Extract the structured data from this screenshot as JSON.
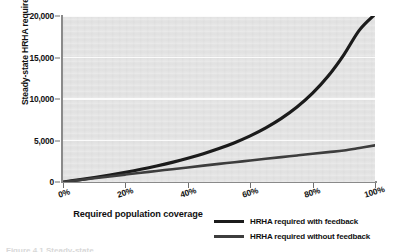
{
  "chart_data": {
    "type": "line",
    "title": "",
    "xlabel": "Required population coverage",
    "ylabel": "Steady-state HRHA required",
    "xlim": [
      0,
      100
    ],
    "ylim": [
      0,
      20000
    ],
    "grid": true,
    "legend_position": "bottom-right",
    "x_tick_labels": [
      "0%",
      "20%",
      "40%",
      "60%",
      "80%",
      "100%"
    ],
    "x_tick_values": [
      0,
      20,
      40,
      60,
      80,
      100
    ],
    "y_tick_labels": [
      "0",
      "5,000",
      "10,000",
      "15,000",
      "20,000"
    ],
    "y_tick_values": [
      0,
      5000,
      10000,
      15000,
      20000
    ],
    "x": [
      0,
      5,
      10,
      15,
      20,
      25,
      30,
      35,
      40,
      45,
      50,
      55,
      60,
      65,
      70,
      75,
      80,
      85,
      90,
      95,
      100
    ],
    "series": [
      {
        "name": "HRHA required with feedback",
        "color": "#1b1b1b",
        "values": [
          0,
          260,
          540,
          840,
          1170,
          1530,
          1930,
          2370,
          2860,
          3410,
          4030,
          4740,
          5560,
          6520,
          7660,
          9030,
          10700,
          12760,
          15320,
          18300,
          20200
        ]
      },
      {
        "name": "HRHA required without feedback",
        "color": "#3d3d3d",
        "values": [
          0,
          225,
          450,
          672,
          893,
          1112,
          1329,
          1544,
          1757,
          1969,
          2179,
          2387,
          2593,
          2798,
          3001,
          3202,
          3401,
          3599,
          3795,
          4098,
          4420
        ]
      }
    ]
  },
  "legend": {
    "items": [
      {
        "label": "HRHA required with feedback",
        "swatch_class": "sw-feedback"
      },
      {
        "label": "HRHA required without feedback",
        "swatch_class": "sw-nofeedback"
      }
    ]
  },
  "colors": {
    "plot_background": "#e4e4e4",
    "gridline": "#fbfbfb",
    "axis": "#8a8a8a",
    "text": "#111111",
    "series_with_feedback": "#1b1b1b",
    "series_without_feedback": "#3d3d3d"
  },
  "caption_stub": "Figure 4.1  Steady-state"
}
